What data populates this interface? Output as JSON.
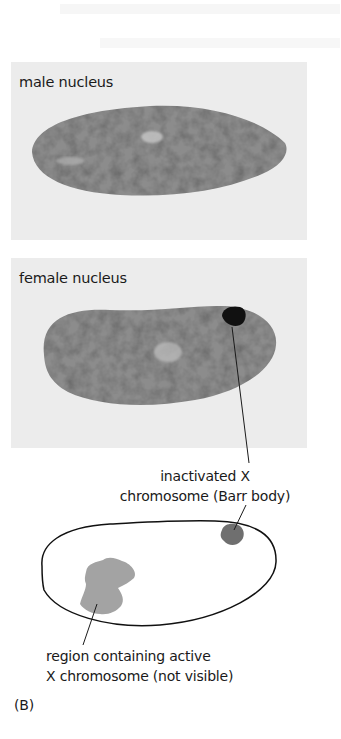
{
  "figure": {
    "panel_letter": "(B)",
    "panels": [
      {
        "id": "male",
        "label": "male nucleus"
      },
      {
        "id": "female",
        "label": "female nucleus"
      }
    ],
    "schematic": {
      "barr_body_label_line1": "inactivated X",
      "barr_body_label_line2": "chromosome (Barr body)",
      "active_region_label_line1": "region containing active",
      "active_region_label_line2": "X chromosome (not visible)"
    },
    "colors": {
      "panel_bg": "#ececec",
      "nucleus": "#8a8a8a",
      "barr_body_micrograph": "#111111",
      "barr_body_schematic": "#6f6f6f",
      "active_region": "#a3a3a3",
      "outline": "#111111"
    }
  }
}
